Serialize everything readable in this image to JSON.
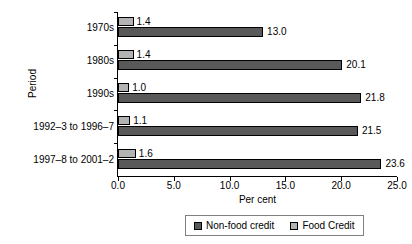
{
  "chart_data": {
    "type": "bar",
    "orientation": "horizontal",
    "title": "",
    "xlabel": "Per cent",
    "ylabel": "Period",
    "xlim": [
      0.0,
      25.0
    ],
    "xticks": [
      "0.0",
      "5.0",
      "10.0",
      "15.0",
      "20.0",
      "25.0"
    ],
    "xtick_values": [
      0.0,
      5.0,
      10.0,
      15.0,
      20.0,
      25.0
    ],
    "grid": false,
    "legend_position": "bottom",
    "categories": [
      "1970s",
      "1980s",
      "1990s",
      "1992–3 to 1996–7",
      "1997–8 to 2001–2"
    ],
    "series": [
      {
        "name": "Food Credit",
        "color": "#b3b3b3",
        "values": [
          1.4,
          1.4,
          1.0,
          1.1,
          1.6
        ],
        "labels": [
          "1.4",
          "1.4",
          "1.0",
          "1.1",
          "1.6"
        ]
      },
      {
        "name": "Non-food credit",
        "color": "#595959",
        "values": [
          13.0,
          20.1,
          21.8,
          21.5,
          23.6
        ],
        "labels": [
          "13.0",
          "20.1",
          "21.8",
          "21.5",
          "23.6"
        ]
      }
    ],
    "legend": [
      {
        "name": "Non-food credit",
        "color": "#595959"
      },
      {
        "name": "Food Credit",
        "color": "#b3b3b3"
      }
    ]
  }
}
